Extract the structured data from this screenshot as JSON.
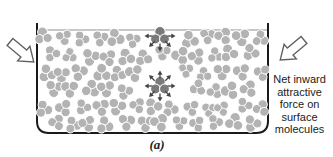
{
  "figure": {
    "caption": "(a)",
    "side_label": "Net inward attractive force on surface molecules",
    "side_label_lines": [
      "Net inward",
      "attractive",
      "force on",
      "surface",
      "molecules"
    ]
  },
  "diagram": {
    "colors": {
      "molecule": "#b3b3b3",
      "molecule_gap": "#ffffff",
      "highlight_molecule": "#7a7a7a",
      "force_arrow": "#444444",
      "container_outline": "#1a1a1a",
      "surface_line": "#8f8f8f",
      "big_arrow_fill": "#ffffff",
      "big_arrow_outline": "#606060"
    },
    "molecule_grid": {
      "rows": 6,
      "cols": 13,
      "x0": 46,
      "y0": 38,
      "dx": 17.8,
      "dy": 17.2,
      "row_offset": 8,
      "jitter_x": 3,
      "jitter_y": 2.5,
      "seed": 7
    },
    "bounds": {
      "x_min": 43,
      "x_max": 262
    },
    "highlights": [
      {
        "name": "surface-molecule",
        "x": 160,
        "y": 36,
        "clear_radius": 12,
        "arrow_angles": [
          0,
          45,
          90,
          135,
          180
        ]
      },
      {
        "name": "interior-molecule",
        "x": 160,
        "y": 86,
        "clear_radius": 16,
        "arrow_angles": [
          0,
          45,
          90,
          135,
          180,
          225,
          270,
          315
        ]
      }
    ]
  }
}
